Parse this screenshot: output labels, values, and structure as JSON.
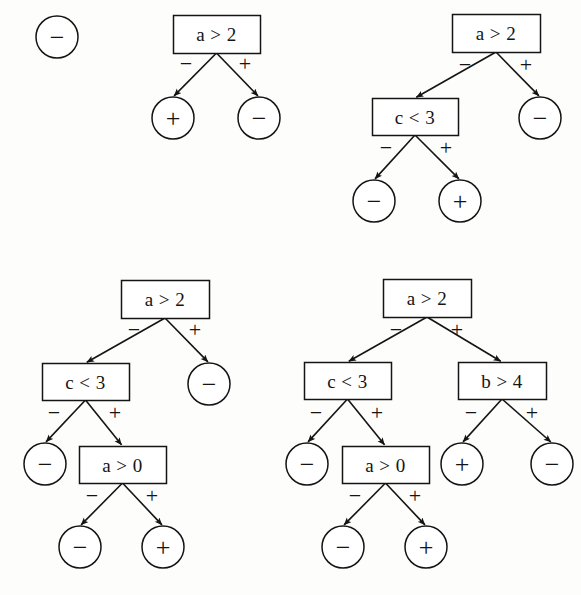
{
  "figure": {
    "background_color": "#fdfdfb",
    "ink_color": "#141414",
    "width": 581,
    "height": 595,
    "panel_count": 4
  },
  "glyphs": {
    "minus": "−",
    "plus": "+"
  },
  "panels": [
    {
      "id": "panel-1",
      "name": "single-leaf-tree",
      "nodes": [
        {
          "id": "p1-leaf-root",
          "kind": "leaf",
          "label": "−",
          "cx": 57,
          "cy": 37,
          "r": 21
        }
      ],
      "edges": []
    },
    {
      "id": "panel-2",
      "name": "depth-one-tree",
      "nodes": [
        {
          "id": "p2-root",
          "kind": "test",
          "label": "a > 2",
          "x": 173,
          "y": 15,
          "w": 87,
          "h": 38
        },
        {
          "id": "p2-left",
          "kind": "leaf",
          "label": "+",
          "cx": 173,
          "cy": 118,
          "r": 21
        },
        {
          "id": "p2-right",
          "kind": "leaf",
          "label": "−",
          "cx": 259,
          "cy": 118,
          "r": 21
        }
      ],
      "edges": [
        {
          "from": "p2-root",
          "to": "p2-left",
          "label": "−",
          "lx": 186,
          "ly": 64
        },
        {
          "from": "p2-root",
          "to": "p2-right",
          "label": "+",
          "lx": 245,
          "ly": 64
        }
      ]
    },
    {
      "id": "panel-3",
      "name": "depth-two-left-tree",
      "nodes": [
        {
          "id": "p3-root",
          "kind": "test",
          "label": "a > 2",
          "x": 452,
          "y": 14,
          "w": 88,
          "h": 38
        },
        {
          "id": "p3-c3",
          "kind": "test",
          "label": "c < 3",
          "x": 372,
          "y": 98,
          "w": 86,
          "h": 37
        },
        {
          "id": "p3-right",
          "kind": "leaf",
          "label": "−",
          "cx": 540,
          "cy": 118,
          "r": 21
        },
        {
          "id": "p3-ll",
          "kind": "leaf",
          "label": "−",
          "cx": 374,
          "cy": 201,
          "r": 21
        },
        {
          "id": "p3-lr",
          "kind": "leaf",
          "label": "+",
          "cx": 460,
          "cy": 201,
          "r": 21
        }
      ],
      "edges": [
        {
          "from": "p3-root",
          "to": "p3-c3",
          "label": "−",
          "lx": 465,
          "ly": 65
        },
        {
          "from": "p3-root",
          "to": "p3-right",
          "label": "+",
          "lx": 526,
          "ly": 65
        },
        {
          "from": "p3-c3",
          "to": "p3-ll",
          "label": "−",
          "lx": 386,
          "ly": 148
        },
        {
          "from": "p3-c3",
          "to": "p3-lr",
          "label": "+",
          "lx": 446,
          "ly": 148
        }
      ]
    },
    {
      "id": "panel-4",
      "name": "depth-three-left-tree",
      "nodes": [
        {
          "id": "p4-root",
          "kind": "test",
          "label": "a > 2",
          "x": 121,
          "y": 280,
          "w": 88,
          "h": 38
        },
        {
          "id": "p4-c3",
          "kind": "test",
          "label": "c < 3",
          "x": 42,
          "y": 363,
          "w": 87,
          "h": 37
        },
        {
          "id": "p4-right",
          "kind": "leaf",
          "label": "−",
          "cx": 209,
          "cy": 384,
          "r": 21
        },
        {
          "id": "p4-ll",
          "kind": "leaf",
          "label": "−",
          "cx": 45,
          "cy": 464,
          "r": 21
        },
        {
          "id": "p4-a0",
          "kind": "test",
          "label": "a > 0",
          "x": 79,
          "y": 446,
          "w": 87,
          "h": 37
        },
        {
          "id": "p4-al",
          "kind": "leaf",
          "label": "−",
          "cx": 80,
          "cy": 547,
          "r": 21
        },
        {
          "id": "p4-ar",
          "kind": "leaf",
          "label": "+",
          "cx": 163,
          "cy": 547,
          "r": 21
        }
      ],
      "edges": [
        {
          "from": "p4-root",
          "to": "p4-c3",
          "label": "−",
          "lx": 134,
          "ly": 330
        },
        {
          "from": "p4-root",
          "to": "p4-right",
          "label": "+",
          "lx": 195,
          "ly": 330
        },
        {
          "from": "p4-c3",
          "to": "p4-ll",
          "label": "−",
          "lx": 54,
          "ly": 413
        },
        {
          "from": "p4-c3",
          "to": "p4-a0",
          "label": "+",
          "lx": 115,
          "ly": 413
        },
        {
          "from": "p4-a0",
          "to": "p4-al",
          "label": "−",
          "lx": 92,
          "ly": 496
        },
        {
          "from": "p4-a0",
          "to": "p4-ar",
          "label": "+",
          "lx": 152,
          "ly": 496
        }
      ]
    },
    {
      "id": "panel-5",
      "name": "depth-three-full-tree",
      "nodes": [
        {
          "id": "p5-root",
          "kind": "test",
          "label": "a > 2",
          "x": 383,
          "y": 279,
          "w": 88,
          "h": 38
        },
        {
          "id": "p5-c3",
          "kind": "test",
          "label": "c < 3",
          "x": 304,
          "y": 362,
          "w": 87,
          "h": 37
        },
        {
          "id": "p5-b4",
          "kind": "test",
          "label": "b > 4",
          "x": 458,
          "y": 362,
          "w": 88,
          "h": 37
        },
        {
          "id": "p5-ll",
          "kind": "leaf",
          "label": "−",
          "cx": 307,
          "cy": 464,
          "r": 21
        },
        {
          "id": "p5-a0",
          "kind": "test",
          "label": "a > 0",
          "x": 342,
          "y": 446,
          "w": 87,
          "h": 37
        },
        {
          "id": "p5-al",
          "kind": "leaf",
          "label": "−",
          "cx": 343,
          "cy": 547,
          "r": 21
        },
        {
          "id": "p5-ar",
          "kind": "leaf",
          "label": "+",
          "cx": 426,
          "cy": 547,
          "r": 21
        },
        {
          "id": "p5-bl",
          "kind": "leaf",
          "label": "+",
          "cx": 462,
          "cy": 464,
          "r": 21
        },
        {
          "id": "p5-br",
          "kind": "leaf",
          "label": "−",
          "cx": 552,
          "cy": 464,
          "r": 21
        }
      ],
      "edges": [
        {
          "from": "p5-root",
          "to": "p5-c3",
          "label": "−",
          "lx": 396,
          "ly": 330
        },
        {
          "from": "p5-root",
          "to": "p5-b4",
          "label": "+",
          "lx": 457,
          "ly": 330
        },
        {
          "from": "p5-c3",
          "to": "p5-ll",
          "label": "−",
          "lx": 316,
          "ly": 413
        },
        {
          "from": "p5-c3",
          "to": "p5-a0",
          "label": "+",
          "lx": 377,
          "ly": 413
        },
        {
          "from": "p5-a0",
          "to": "p5-al",
          "label": "−",
          "lx": 355,
          "ly": 496
        },
        {
          "from": "p5-a0",
          "to": "p5-ar",
          "label": "+",
          "lx": 415,
          "ly": 496
        },
        {
          "from": "p5-b4",
          "to": "p5-bl",
          "label": "−",
          "lx": 471,
          "ly": 413
        },
        {
          "from": "p5-b4",
          "to": "p5-br",
          "label": "+",
          "lx": 532,
          "ly": 413
        }
      ]
    }
  ]
}
